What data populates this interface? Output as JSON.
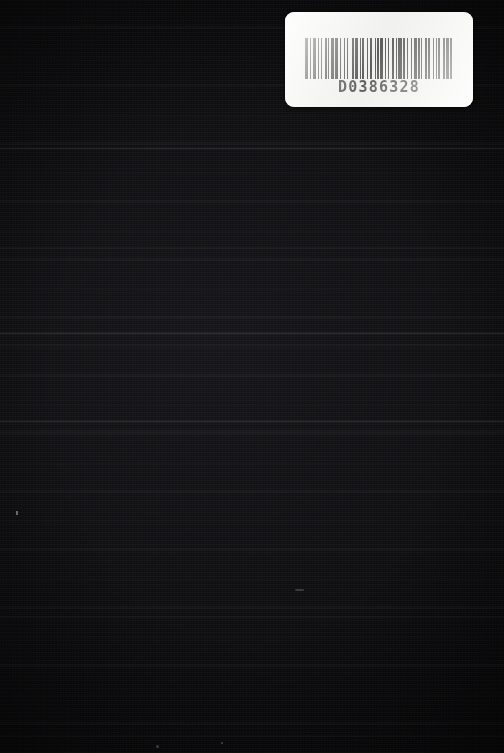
{
  "scene": {
    "kind": "photograph",
    "subject": "dark textured book cover with library barcode label",
    "width": 504,
    "height": 753,
    "background_color": "#0c0c0e",
    "texture": "horizontal scanline banding on near-black cloth"
  },
  "barcode_label": {
    "code_text": "D0386328",
    "label_color": "#f3f3f1",
    "bar_color": "#111111",
    "bar_pattern": [
      3,
      2,
      1,
      2,
      3,
      2,
      1,
      2,
      1,
      3,
      2,
      1,
      1,
      2,
      3,
      1,
      2,
      2,
      1,
      3,
      1,
      2,
      1,
      4,
      2,
      1,
      3,
      2,
      1,
      1,
      2,
      3,
      1,
      2,
      2,
      3,
      1,
      1,
      2,
      1,
      3,
      2,
      1,
      2,
      1,
      3,
      2,
      2,
      1,
      1,
      3,
      1,
      2,
      2,
      1,
      3,
      1,
      2,
      3,
      1,
      2,
      1,
      1,
      3,
      2,
      1,
      2,
      3,
      1,
      2,
      1,
      1,
      2,
      3,
      2,
      1,
      3,
      1,
      2,
      2
    ]
  }
}
